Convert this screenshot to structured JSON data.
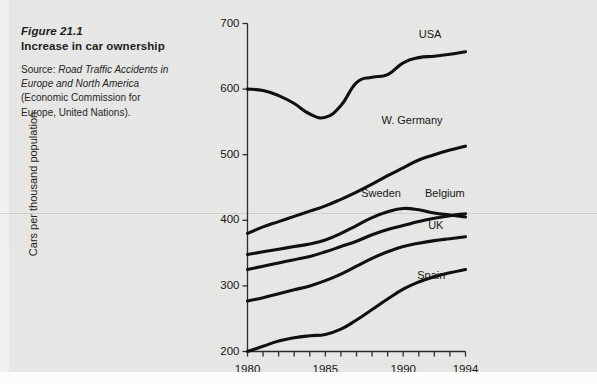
{
  "caption": {
    "figure_number": "Figure 21.1",
    "title": "Increase in car ownership",
    "source_prefix": "Source: ",
    "source_italic": "Road Traffic Accidents in Europe and North America",
    "source_rest": " (Economic Commission for Europe, United Nations)."
  },
  "chart_data": {
    "type": "line",
    "title": "Increase in car ownership",
    "xlabel": "",
    "ylabel": "Cars per thousand population",
    "xlim": [
      1980,
      1994
    ],
    "ylim": [
      200,
      700
    ],
    "yticks": [
      200,
      300,
      400,
      500,
      600,
      700
    ],
    "xticks": [
      1980,
      1981,
      1982,
      1983,
      1984,
      1985,
      1986,
      1987,
      1988,
      1989,
      1990,
      1991,
      1992,
      1993,
      1994
    ],
    "xtick_labels_shown": [
      "1980",
      "1985",
      "1990",
      "1994"
    ],
    "grid": false,
    "legend_position": "inline-labels",
    "x": [
      1980,
      1981,
      1982,
      1983,
      1984,
      1985,
      1986,
      1987,
      1988,
      1989,
      1990,
      1991,
      1992,
      1993,
      1994
    ],
    "series": [
      {
        "name": "USA",
        "label": "USA",
        "values": [
          600,
          598,
          590,
          578,
          562,
          557,
          575,
          610,
          618,
          622,
          640,
          648,
          650,
          653,
          657
        ]
      },
      {
        "name": "W. Germany",
        "label": "W. Germany",
        "values": [
          380,
          390,
          398,
          406,
          414,
          422,
          432,
          443,
          455,
          468,
          480,
          492,
          500,
          507,
          513
        ]
      },
      {
        "name": "Sweden",
        "label": "Sweden",
        "values": [
          348,
          352,
          356,
          360,
          364,
          370,
          380,
          392,
          404,
          413,
          418,
          416,
          411,
          408,
          405
        ]
      },
      {
        "name": "Belgium",
        "label": "Belgium",
        "values": [
          325,
          330,
          335,
          340,
          345,
          352,
          360,
          368,
          378,
          386,
          392,
          398,
          403,
          407,
          410
        ]
      },
      {
        "name": "UK",
        "label": "UK",
        "values": [
          277,
          282,
          288,
          294,
          300,
          308,
          318,
          330,
          342,
          352,
          360,
          365,
          369,
          372,
          375
        ]
      },
      {
        "name": "Spain",
        "label": "Spain",
        "values": [
          200,
          208,
          216,
          221,
          224,
          226,
          234,
          248,
          264,
          280,
          295,
          306,
          314,
          320,
          325
        ]
      }
    ],
    "series_label_points": [
      {
        "name": "USA",
        "x": 1991.0,
        "y": 682
      },
      {
        "name": "W. Germany",
        "x": 1988.6,
        "y": 552
      },
      {
        "name": "Sweden",
        "x": 1987.3,
        "y": 440
      },
      {
        "name": "Belgium",
        "x": 1991.4,
        "y": 440
      },
      {
        "name": "UK",
        "x": 1991.6,
        "y": 392
      },
      {
        "name": "Spain",
        "x": 1990.9,
        "y": 315
      }
    ]
  }
}
